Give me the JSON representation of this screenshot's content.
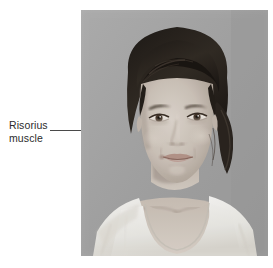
{
  "figure": {
    "type": "anatomy-photo-figure",
    "background_color": "#ffffff",
    "callout": {
      "line_1": "Risorius",
      "line_2": "muscle",
      "full_text": "Risorius muscle",
      "text_color": "#2b2b2b",
      "leader_line_color": "#4a4a4a",
      "leader_points_to": "corner of mouth / cheek"
    },
    "photo": {
      "description": "Black and white portrait photograph of a young woman facing the camera",
      "subject": "young woman with dark hair pulled back into a ponytail, wearing a white scoop-neck t-shirt",
      "color_mode": "grayscale",
      "background_color": "#a9a9a9",
      "hair_color": "#2a2520",
      "skin_color": "#cfc6bd",
      "shirt_color": "#f4f2ef",
      "x": 81,
      "y": 10,
      "width": 187,
      "height": 246
    }
  }
}
